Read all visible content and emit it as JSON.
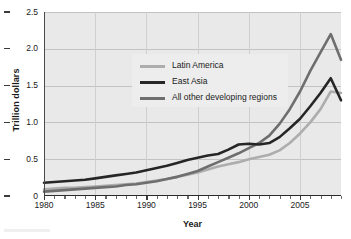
{
  "chart_data": {
    "type": "line",
    "title": "",
    "xlabel": "Year",
    "ylabel": "Trillion dollars",
    "xlim": [
      1980,
      2009
    ],
    "ylim": [
      0,
      2.5
    ],
    "yticks": [
      "0",
      "0.5",
      "1.0",
      "1.5",
      "2.0",
      "2.5"
    ],
    "ytick_values": [
      0,
      0.5,
      1.0,
      1.5,
      2.0,
      2.5
    ],
    "xticks": [
      "1980",
      "1985",
      "1990",
      "1995",
      "2000",
      "2005"
    ],
    "xtick_values": [
      1980,
      1985,
      1990,
      1995,
      2000,
      2005
    ],
    "grid": true,
    "legend_position": "upper-left-inside",
    "x": [
      1980,
      1981,
      1982,
      1983,
      1984,
      1985,
      1986,
      1987,
      1988,
      1989,
      1990,
      1991,
      1992,
      1993,
      1994,
      1995,
      1996,
      1997,
      1998,
      1999,
      2000,
      2001,
      2002,
      2003,
      2004,
      2005,
      2006,
      2007,
      2008,
      2009
    ],
    "series": [
      {
        "name": "Latin America",
        "color": "#adadad",
        "values": [
          0.09,
          0.1,
          0.11,
          0.11,
          0.12,
          0.13,
          0.14,
          0.15,
          0.16,
          0.17,
          0.19,
          0.21,
          0.23,
          0.26,
          0.29,
          0.32,
          0.36,
          0.4,
          0.43,
          0.46,
          0.5,
          0.53,
          0.56,
          0.62,
          0.72,
          0.85,
          1.0,
          1.18,
          1.42,
          1.4
        ]
      },
      {
        "name": "East Asia",
        "color": "#262626",
        "values": [
          0.18,
          0.19,
          0.2,
          0.21,
          0.22,
          0.24,
          0.26,
          0.28,
          0.3,
          0.32,
          0.35,
          0.38,
          0.41,
          0.45,
          0.49,
          0.52,
          0.55,
          0.57,
          0.63,
          0.7,
          0.71,
          0.7,
          0.72,
          0.8,
          0.92,
          1.05,
          1.22,
          1.4,
          1.6,
          1.3
        ]
      },
      {
        "name": "All other developing regions",
        "color": "#6e6e6e",
        "values": [
          0.06,
          0.07,
          0.08,
          0.09,
          0.1,
          0.11,
          0.12,
          0.13,
          0.15,
          0.16,
          0.18,
          0.2,
          0.23,
          0.26,
          0.3,
          0.34,
          0.4,
          0.46,
          0.52,
          0.58,
          0.65,
          0.72,
          0.82,
          0.98,
          1.18,
          1.42,
          1.7,
          1.95,
          2.2,
          1.85
        ]
      }
    ],
    "series_endpoints": {
      "latin_america_2009": 1.4,
      "east_asia_2009": 1.5,
      "all_other_2009": 2.3
    }
  },
  "legend": {
    "items": [
      {
        "label": "Latin America",
        "color": "#adadad"
      },
      {
        "label": "East Asia",
        "color": "#262626"
      },
      {
        "label": "All other developing regions",
        "color": "#6e6e6e"
      }
    ]
  },
  "axes": {
    "y_title": "Trillion dollars",
    "x_title": "Year"
  }
}
